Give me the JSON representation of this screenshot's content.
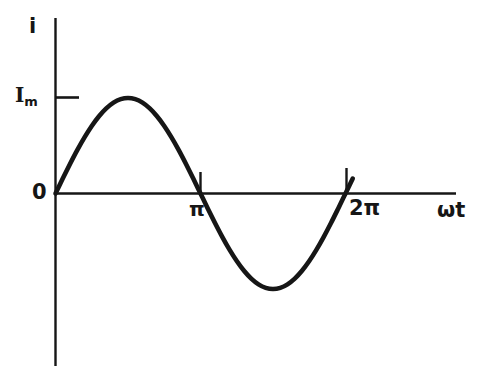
{
  "figure": {
    "width": 497,
    "height": 376,
    "background": "#ffffff",
    "ink_color": "#161616"
  },
  "labels": {
    "y_axis": "i",
    "amplitude_symbol": "I",
    "amplitude_subscript": "m",
    "origin": "0",
    "tick_pi": "π",
    "tick_2pi": "2π",
    "x_axis": "ωt"
  },
  "chart_data": {
    "type": "line",
    "title": "",
    "xlabel": "ωt",
    "ylabel": "i",
    "grid": false,
    "legend": null,
    "curve_label": "i = I_m sin(ωt)",
    "amplitude": 1.0,
    "amplitude_label": "I_m",
    "xlim": [
      0,
      7.33
    ],
    "ylim": [
      -1.18,
      1.85
    ],
    "xticks": [
      3.14159,
      6.28319
    ],
    "xticklabels": [
      "π",
      "2π"
    ],
    "yticks": [
      0,
      1
    ],
    "yticklabels": [
      "0",
      "I_m"
    ],
    "x": [
      0,
      0.1571,
      0.3142,
      0.4712,
      0.6283,
      0.7854,
      0.9425,
      1.0996,
      1.2566,
      1.4137,
      1.5708,
      1.7279,
      1.885,
      2.042,
      2.1991,
      2.3562,
      2.5133,
      2.6704,
      2.8274,
      2.9845,
      3.1416,
      3.2987,
      3.4558,
      3.6128,
      3.7699,
      3.927,
      4.0841,
      4.2412,
      4.3982,
      4.5553,
      4.7124,
      4.8695,
      5.0265,
      5.1836,
      5.3407,
      5.4978,
      5.6549,
      5.8119,
      5.969,
      6.1261,
      6.2832,
      6.4403
    ],
    "y": [
      0,
      0.1564,
      0.309,
      0.454,
      0.5878,
      0.7071,
      0.809,
      0.891,
      0.9511,
      0.9877,
      1.0,
      0.9877,
      0.9511,
      0.891,
      0.809,
      0.7071,
      0.5878,
      0.454,
      0.309,
      0.1564,
      0,
      -0.1564,
      -0.309,
      -0.454,
      -0.5878,
      -0.7071,
      -0.809,
      -0.891,
      -0.9511,
      -0.9877,
      -1.0,
      -0.9877,
      -0.9511,
      -0.891,
      -0.809,
      -0.7071,
      -0.5878,
      -0.454,
      -0.309,
      -0.1564,
      0,
      0.1564
    ]
  }
}
